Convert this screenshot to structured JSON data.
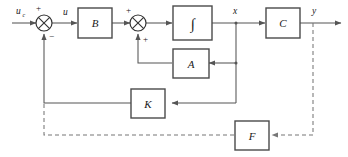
{
  "diagram": {
    "signals": {
      "reference_input": "u",
      "reference_input_subscript": "c",
      "control_input": "u",
      "state": "x",
      "output": "y"
    },
    "blocks": [
      {
        "id": "B",
        "label": "B",
        "name": "input-matrix"
      },
      {
        "id": "INT",
        "label": "∫",
        "name": "integrator"
      },
      {
        "id": "C",
        "label": "C",
        "name": "output-matrix"
      },
      {
        "id": "A",
        "label": "A",
        "name": "system-matrix"
      },
      {
        "id": "K",
        "label": "K",
        "name": "state-feedback-gain"
      },
      {
        "id": "F",
        "label": "F",
        "name": "output-feedback"
      }
    ],
    "summing_junctions": [
      {
        "id": "sum1",
        "name": "error-summing-junction",
        "sign_top": "+",
        "sign_bottom": "−"
      },
      {
        "id": "sum2",
        "name": "state-summing-junction",
        "sign_top": "+",
        "sign_bottom": "+"
      }
    ],
    "colors": {
      "line": "#555555",
      "dashed_line": "#777777",
      "box_border": "#4a4a4a",
      "text": "#1a1a1a",
      "background": "#ffffff"
    }
  }
}
